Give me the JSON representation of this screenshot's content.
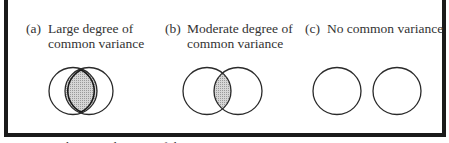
{
  "panels": [
    {
      "tag": "(a)",
      "line1": "Large degree of",
      "line2": "common variance",
      "overlap": "large"
    },
    {
      "tag": "(b)",
      "line1": "Moderate degree of",
      "line2": "common variance",
      "overlap": "moderate"
    },
    {
      "tag": "(c)",
      "line1": "No common variance",
      "line2": "",
      "overlap": "none"
    }
  ],
  "caption": "Figure 3   Schematic diagram of the",
  "colors": {
    "border": "#1a1a1a",
    "stroke": "#2a2a2a",
    "overlap_fill": "#bdbdbd"
  }
}
